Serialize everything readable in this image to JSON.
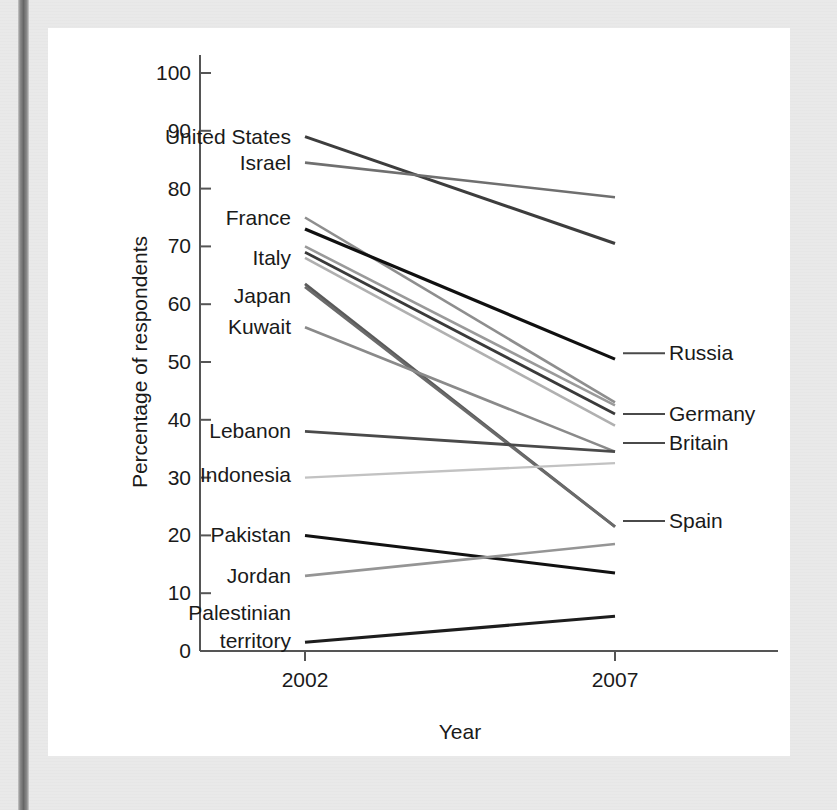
{
  "figure": {
    "axes": {
      "ylabel": "Percentage of respondents",
      "xlabel": "Year",
      "y_ticks": [
        "0",
        "10",
        "20",
        "30",
        "40",
        "50",
        "60",
        "70",
        "80",
        "90",
        "100"
      ],
      "x_ticks": [
        "2002",
        "2007"
      ]
    }
  },
  "chart_data": {
    "type": "line",
    "title": "",
    "subtitle": "",
    "xlabel": "Year",
    "ylabel": "Percentage of respondents",
    "x": [
      2002,
      2007
    ],
    "x_tick_labels": [
      "2002",
      "2007"
    ],
    "y_tick_labels": [
      "0",
      "10",
      "20",
      "30",
      "40",
      "50",
      "60",
      "70",
      "80",
      "90",
      "100"
    ],
    "ylim": [
      0,
      100
    ],
    "xlim": [
      2002,
      2007
    ],
    "grid": false,
    "legend": "inline-labels",
    "legend_position": "left and right of lines (direct labelling)",
    "series": [
      {
        "name": "United States",
        "label_side": "left",
        "color": "#3d3d3d",
        "width": 3.0,
        "values": [
          89.0,
          70.5
        ]
      },
      {
        "name": "Israel",
        "label_side": "left",
        "color": "#6f6f6f",
        "width": 2.6,
        "values": [
          84.5,
          78.5
        ]
      },
      {
        "name": "France",
        "label_side": "left",
        "color": "#8e8e8e",
        "width": 2.6,
        "values": [
          75.0,
          43.0
        ]
      },
      {
        "name": "Russia",
        "label_side": "right",
        "color": "#101010",
        "width": 3.2,
        "values": [
          73.0,
          50.5
        ]
      },
      {
        "name": "Italy",
        "label_side": "left",
        "color": "#9a9a9a",
        "width": 2.6,
        "values": [
          70.0,
          42.5
        ]
      },
      {
        "name": "Germany",
        "label_side": "right",
        "color": "#3a3a3a",
        "width": 2.8,
        "values": [
          69.0,
          41.0
        ]
      },
      {
        "name": "Britain",
        "label_side": "right",
        "color": "#b0b0b0",
        "width": 2.6,
        "values": [
          68.0,
          39.0
        ]
      },
      {
        "name": "Japan",
        "label_side": "left",
        "color": "#5a5a5a",
        "width": 2.8,
        "values": [
          63.5,
          21.5
        ]
      },
      {
        "name": "Spain",
        "label_side": "right",
        "color": "#6a6a6a",
        "width": 2.8,
        "values": [
          63.0,
          21.5
        ]
      },
      {
        "name": "Kuwait",
        "label_side": "left",
        "color": "#8a8a8a",
        "width": 2.6,
        "values": [
          56.0,
          34.5
        ]
      },
      {
        "name": "Lebanon",
        "label_side": "left",
        "color": "#4a4a4a",
        "width": 2.8,
        "values": [
          38.0,
          34.5
        ]
      },
      {
        "name": "Indonesia",
        "label_side": "left",
        "color": "#c2c2c2",
        "width": 2.4,
        "values": [
          30.0,
          32.5
        ]
      },
      {
        "name": "Pakistan",
        "label_side": "left",
        "color": "#111111",
        "width": 3.0,
        "values": [
          20.0,
          13.5
        ]
      },
      {
        "name": "Jordan",
        "label_side": "left",
        "color": "#959595",
        "width": 2.6,
        "values": [
          13.0,
          18.5
        ]
      },
      {
        "name": "Palestinian territory",
        "label_side": "left",
        "color": "#1d1d1d",
        "width": 3.0,
        "values": [
          1.5,
          6.0
        ]
      }
    ],
    "left_labels": [
      {
        "text": "United States",
        "y": 89.0
      },
      {
        "text": "Israel",
        "y": 84.5
      },
      {
        "text": "France",
        "y": 75.0
      },
      {
        "text": "Italy",
        "y": 68.0
      },
      {
        "text": "Japan",
        "y": 61.5
      },
      {
        "text": "Kuwait",
        "y": 56.0
      },
      {
        "text": "Lebanon",
        "y": 38.0
      },
      {
        "text": "Indonesia",
        "y": 30.5
      },
      {
        "text": "Pakistan",
        "y": 20.0
      },
      {
        "text": "Jordan",
        "y": 13.0
      },
      {
        "text": "Palestinian",
        "y": 6.5
      },
      {
        "text": "territory",
        "y": 1.8
      }
    ],
    "right_labels": [
      {
        "text": "Russia",
        "y": 51.5
      },
      {
        "text": "Germany",
        "y": 41.0
      },
      {
        "text": "Britain",
        "y": 36.0
      },
      {
        "text": "Spain",
        "y": 22.5
      }
    ]
  }
}
